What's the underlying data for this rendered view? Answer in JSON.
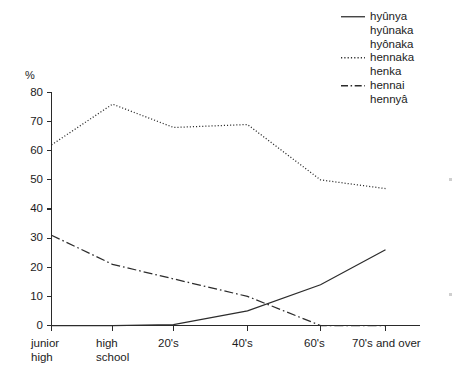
{
  "chart_data": {
    "type": "line",
    "title": "",
    "xlabel": "",
    "ylabel": "%",
    "ylim": [
      0,
      80
    ],
    "yticks": [
      0,
      10,
      20,
      30,
      40,
      50,
      60,
      70,
      80
    ],
    "ytick_labels": [
      "0",
      "10",
      "20",
      "30",
      "40",
      "50",
      "60",
      "70",
      "80"
    ],
    "categories": [
      "junior high",
      "high school",
      "20's",
      "40's",
      "60's",
      "70's and over"
    ],
    "category_lines": [
      [
        "junior",
        "high"
      ],
      [
        "high",
        "school"
      ],
      [
        "20's",
        ""
      ],
      [
        "40's",
        ""
      ],
      [
        "60's",
        ""
      ],
      [
        "70's and over",
        ""
      ]
    ],
    "grid": false,
    "legend_position": "top-right",
    "series": [
      {
        "name": "hyûnya hyûnaka hyônaka",
        "style": "solid",
        "label_lines": [
          "hyûnya",
          "hyûnaka",
          "hyônaka"
        ],
        "values": [
          0,
          0,
          0.3,
          5,
          14,
          26
        ]
      },
      {
        "name": "hennaka henka",
        "style": "dotted",
        "label_lines": [
          "hennaka",
          "henka"
        ],
        "values": [
          62,
          76,
          68,
          69,
          50,
          47
        ]
      },
      {
        "name": "hennai hennyâ",
        "style": "dash-dot",
        "label_lines": [
          "hennai",
          "hennyâ"
        ],
        "values": [
          31,
          21,
          16,
          10,
          0,
          0
        ]
      }
    ]
  },
  "axis": {
    "unit_label": "%"
  },
  "legend": {
    "entries": [
      {
        "key_style": "solid",
        "lines": [
          "hyûnya",
          "hyûnaka",
          "hyônaka"
        ]
      },
      {
        "key_style": "dotted",
        "lines": [
          "hennaka",
          "henka"
        ]
      },
      {
        "key_style": "dash-dot",
        "lines": [
          "hennai",
          "hennyâ"
        ]
      }
    ]
  }
}
